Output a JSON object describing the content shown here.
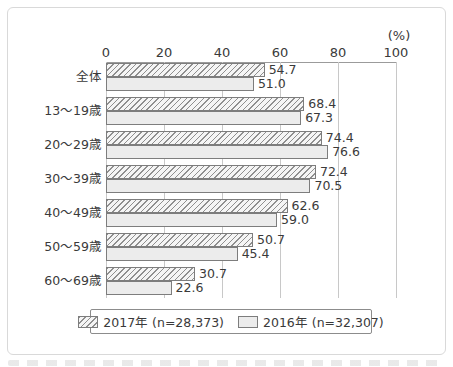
{
  "chart_data": {
    "type": "bar",
    "orientation": "horizontal",
    "title": "",
    "unit_label": "(%)",
    "xlim": [
      0,
      100
    ],
    "x_ticks": [
      0,
      20,
      40,
      60,
      80,
      100
    ],
    "grid": true,
    "legend_position": "bottom",
    "categories": [
      "全体",
      "13〜19歳",
      "20〜29歳",
      "30〜39歳",
      "40〜49歳",
      "50〜59歳",
      "60〜69歳"
    ],
    "series": [
      {
        "name": "2017年",
        "legend_label": "2017年 (n=28,373)",
        "style": "hatched",
        "values": [
          54.7,
          68.4,
          74.4,
          72.4,
          62.6,
          50.7,
          30.7
        ]
      },
      {
        "name": "2016年",
        "legend_label": "2016年 (n=32,307)",
        "style": "solid",
        "values": [
          51.0,
          67.3,
          76.6,
          70.5,
          59.0,
          45.4,
          22.6
        ]
      }
    ]
  },
  "colors": {
    "text": "#3a3a3a",
    "axis": "#9b9b9b",
    "grid": "#c8c8c8",
    "bar-border": "#7d7d7d",
    "hatch-line": "#8f8f8f",
    "bar-2016-fill": "#ececec",
    "frame-border": "#d9d9d9"
  }
}
